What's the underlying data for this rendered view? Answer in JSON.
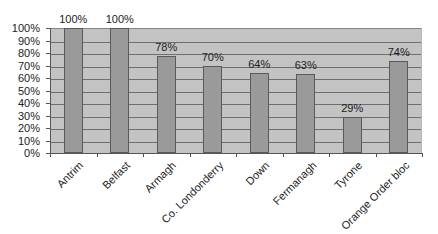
{
  "chart_data": {
    "type": "bar",
    "title": "",
    "xlabel": "",
    "ylabel": "",
    "categories": [
      "Antrim",
      "Belfast",
      "Armagh",
      "Co. Londonderry",
      "Down",
      "Fermanagh",
      "Tyrone",
      "Orange Order bloc"
    ],
    "values": [
      100,
      100,
      78,
      70,
      64,
      63,
      29,
      74
    ],
    "value_labels": [
      "100%",
      "100%",
      "78%",
      "70%",
      "64%",
      "63%",
      "29%",
      "74%"
    ],
    "ylim": [
      0,
      100
    ],
    "yticks": [
      "0%",
      "10%",
      "20%",
      "30%",
      "40%",
      "50%",
      "60%",
      "70%",
      "80%",
      "90%",
      "100%"
    ],
    "grid": true,
    "legend": null,
    "colors": {
      "bar": "#9a9a9a",
      "plot_background": "#c3c3c3",
      "gridline": "#6f6f6f"
    }
  }
}
